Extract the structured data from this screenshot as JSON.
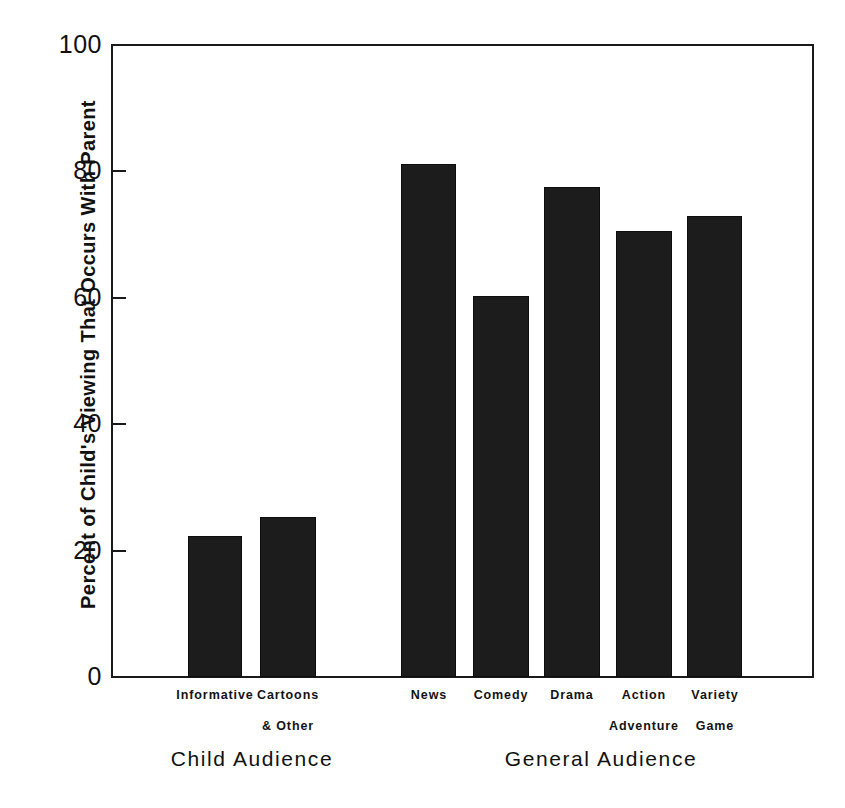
{
  "chart_data": {
    "type": "bar",
    "title": "",
    "xlabel": "",
    "ylabel": "Percent of Child's Viewing That Occurs With Parent",
    "ylim": [
      0,
      100
    ],
    "ytick_labels": [
      "100",
      "80",
      "60",
      "40",
      "20",
      "0"
    ],
    "yticks": [
      100,
      80,
      60,
      40,
      20,
      0
    ],
    "grid": false,
    "legend": "none",
    "categories": [
      "Informative",
      "Cartoons & Other",
      "News",
      "Comedy",
      "Drama",
      "Action Adventure",
      "Variety Game"
    ],
    "values": [
      22.3,
      25.3,
      81.2,
      60.3,
      77.5,
      70.5,
      73.0
    ],
    "groups": [
      {
        "name": "Child Audience",
        "categories": [
          "Informative",
          "Cartoons & Other"
        ]
      },
      {
        "name": "General Audience",
        "categories": [
          "News",
          "Comedy",
          "Drama",
          "Action Adventure",
          "Variety Game"
        ]
      }
    ],
    "bar_color": "#1c1c1c"
  },
  "axis": {
    "y_title": "Percent of Child's Viewing That Occurs With Parent",
    "ticks": [
      {
        "label": "100",
        "value": 100
      },
      {
        "label": "80",
        "value": 80
      },
      {
        "label": "60",
        "value": 60
      },
      {
        "label": "40",
        "value": 40
      },
      {
        "label": "20",
        "value": 20
      },
      {
        "label": "0",
        "value": 0
      }
    ]
  },
  "bars": [
    {
      "label_line1": "Informative",
      "label_line2": "",
      "value": 22.3
    },
    {
      "label_line1": "Cartoons",
      "label_line2": "& Other",
      "value": 25.3
    },
    {
      "label_line1": "News",
      "label_line2": "",
      "value": 81.2
    },
    {
      "label_line1": "Comedy",
      "label_line2": "",
      "value": 60.3
    },
    {
      "label_line1": "Drama",
      "label_line2": "",
      "value": 77.5
    },
    {
      "label_line1": "Action",
      "label_line2": "Adventure",
      "value": 70.5
    },
    {
      "label_line1": "Variety",
      "label_line2": "Game",
      "value": 73.0
    }
  ],
  "groups": [
    {
      "name": "Child Audience"
    },
    {
      "name": "General Audience"
    }
  ]
}
